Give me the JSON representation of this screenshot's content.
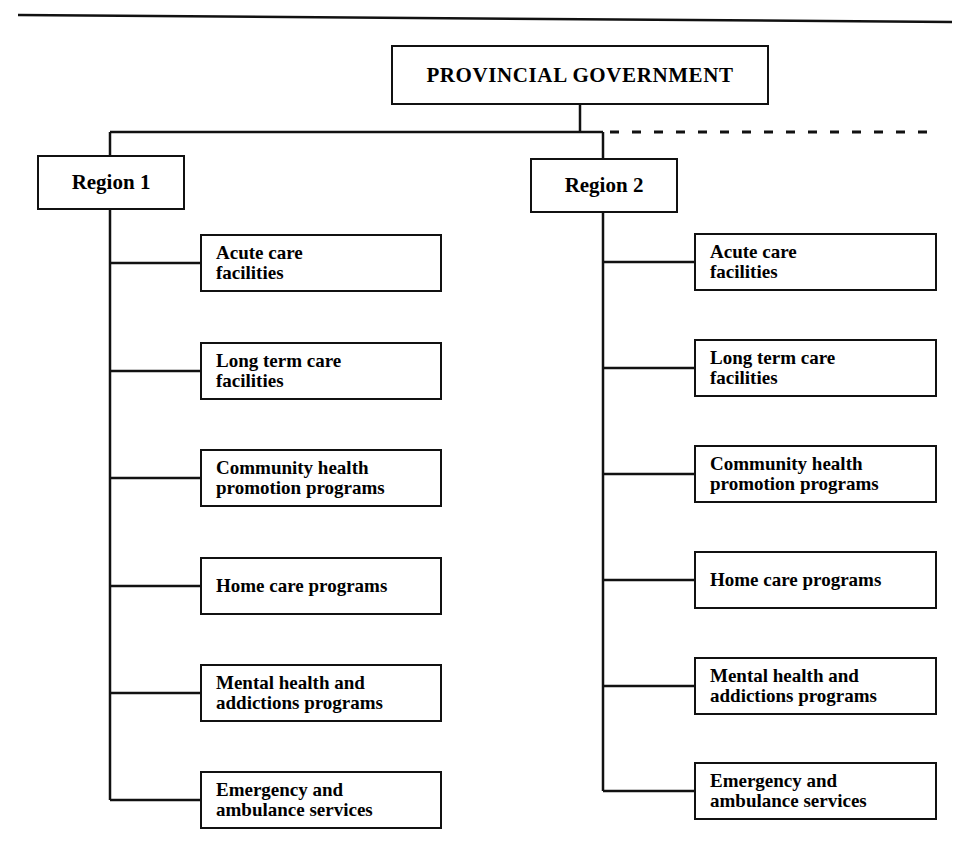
{
  "diagram": {
    "type": "organizational-hierarchy",
    "title_rule": "top-horizontal-rule",
    "root": {
      "label": "PROVINCIAL GOVERNMENT"
    },
    "continuation": {
      "style": "dashed",
      "meaning": "additional regions"
    },
    "regions": [
      {
        "label": "Region 1",
        "children": [
          {
            "label": "Acute care\nfacilities"
          },
          {
            "label": "Long term care\nfacilities"
          },
          {
            "label": "Community health\npromotion programs"
          },
          {
            "label": "Home care programs"
          },
          {
            "label": "Mental health and\naddictions programs"
          },
          {
            "label": "Emergency and\nambulance services"
          }
        ]
      },
      {
        "label": "Region 2",
        "children": [
          {
            "label": "Acute care\nfacilities"
          },
          {
            "label": "Long term care\nfacilities"
          },
          {
            "label": "Community health\npromotion programs"
          },
          {
            "label": "Home care programs"
          },
          {
            "label": "Mental health and\naddictions programs"
          },
          {
            "label": "Emergency and\nambulance services"
          }
        ]
      }
    ],
    "colors": {
      "line": "#111111",
      "box_border": "#111111",
      "background": "#ffffff",
      "text": "#000000"
    }
  }
}
